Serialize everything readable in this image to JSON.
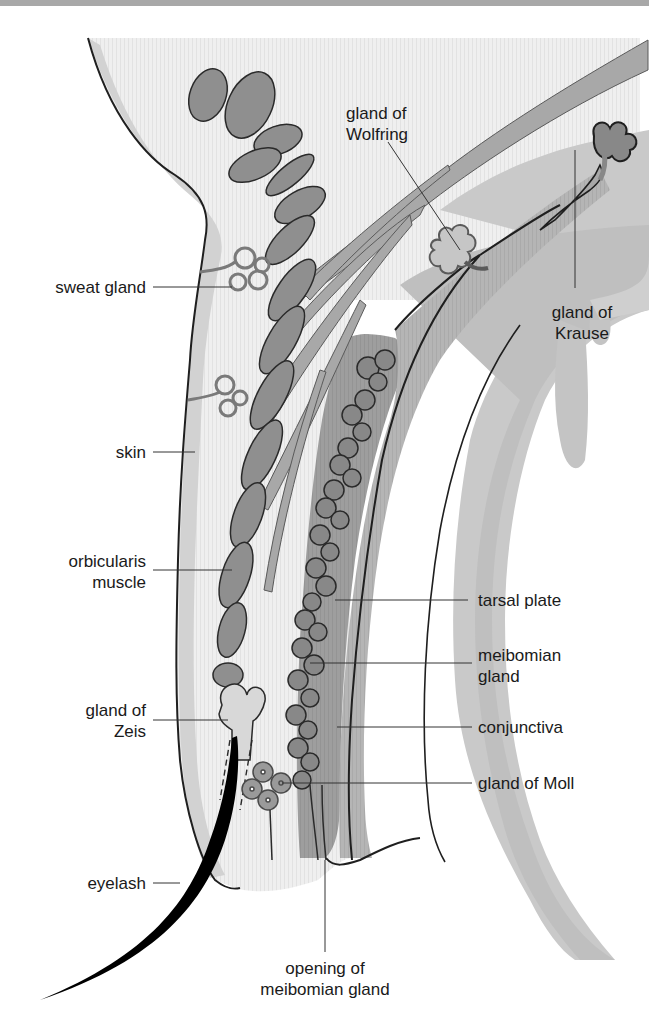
{
  "figure": {
    "colors": {
      "background": "#ffffff",
      "tissue_light": "#ececec",
      "skin_band": "#d2d2d2",
      "muscle": "#8f8f8f",
      "tarsal_plate": "#9c9c9c",
      "conjunctiva": "#bdbdbd",
      "outline": "#1f1f1f",
      "eyelash": "#000000"
    }
  },
  "labels": {
    "gland_of_wolfring": [
      "gland of",
      "Wolfring"
    ],
    "gland_of_krause": [
      "gland of",
      "Krause"
    ],
    "sweat_gland": "sweat gland",
    "skin": "skin",
    "orbicularis_muscle": [
      "orbicularis",
      "muscle"
    ],
    "tarsal_plate": "tarsal plate",
    "meibomian_gland": [
      "meibomian",
      "gland"
    ],
    "gland_of_zeis": [
      "gland of",
      "Zeis"
    ],
    "conjunctiva": "conjunctiva",
    "gland_of_moll": "gland of Moll",
    "eyelash": "eyelash",
    "opening_of_meibomian_gland": [
      "opening of",
      "meibomian gland"
    ]
  }
}
